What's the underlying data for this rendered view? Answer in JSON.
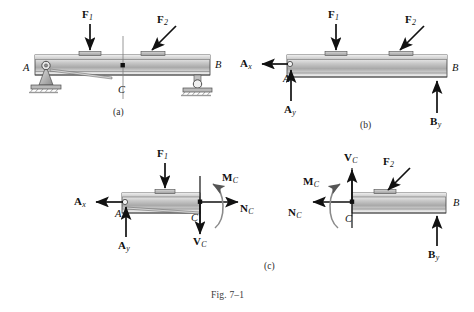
{
  "figure": {
    "caption": "Fig. 7–1",
    "panels": [
      {
        "id": "a",
        "label": "(a)",
        "description": "simply supported beam with pin at A and roller at B, loads F1 and F2, section at C"
      },
      {
        "id": "b",
        "label": "(b)",
        "description": "free-body diagram of whole beam with reactions Ax, Ay, By"
      },
      {
        "id": "c",
        "label": "(c)",
        "description": "free-body diagrams of the two segments cut at C showing NC, VC, MC"
      }
    ]
  },
  "panel_a": {
    "label": "(a)",
    "forces": [
      {
        "name": "F1",
        "base": "F",
        "sub": "1"
      },
      {
        "name": "F2",
        "base": "F",
        "sub": "2"
      }
    ],
    "points": {
      "A": "A",
      "B": "B",
      "C": "C"
    },
    "supports": {
      "pin": "pin-support-A",
      "roller": "roller-support-B"
    }
  },
  "panel_b": {
    "label": "(b)",
    "forces": [
      {
        "name": "F1",
        "base": "F",
        "sub": "1"
      },
      {
        "name": "F2",
        "base": "F",
        "sub": "2"
      }
    ],
    "reactions": [
      {
        "name": "Ax",
        "base": "A",
        "sub": "x"
      },
      {
        "name": "Ay",
        "base": "A",
        "sub": "y"
      },
      {
        "name": "By",
        "base": "B",
        "sub": "y"
      }
    ],
    "points": {
      "A": "A",
      "B": "B"
    }
  },
  "panel_c": {
    "label": "(c)",
    "left_segment": {
      "forces": [
        {
          "name": "F1",
          "base": "F",
          "sub": "1"
        }
      ],
      "reactions": [
        {
          "name": "Ax",
          "base": "A",
          "sub": "x"
        },
        {
          "name": "Ay",
          "base": "A",
          "sub": "y"
        }
      ],
      "internal": [
        {
          "name": "NC",
          "base": "N",
          "sub": "C"
        },
        {
          "name": "VC",
          "base": "V",
          "sub": "C"
        },
        {
          "name": "MC",
          "base": "M",
          "sub": "C"
        }
      ],
      "points": {
        "A": "A",
        "C": "C"
      }
    },
    "right_segment": {
      "forces": [
        {
          "name": "F2",
          "base": "F",
          "sub": "2"
        }
      ],
      "reactions": [
        {
          "name": "By",
          "base": "B",
          "sub": "y"
        }
      ],
      "internal": [
        {
          "name": "NC",
          "base": "N",
          "sub": "C"
        },
        {
          "name": "VC",
          "base": "V",
          "sub": "C"
        },
        {
          "name": "MC",
          "base": "M",
          "sub": "C"
        }
      ],
      "points": {
        "B": "B",
        "C": "C"
      }
    }
  },
  "colors": {
    "ink": "#111111",
    "beam_light": "#f2f2f2",
    "beam_mid": "#bdbdbd",
    "beam_dark": "#8f8f8f",
    "beam_edge": "#4a4a4a",
    "support": "#9a9a9a",
    "caption": "#3a3a3a",
    "background": "#ffffff"
  }
}
